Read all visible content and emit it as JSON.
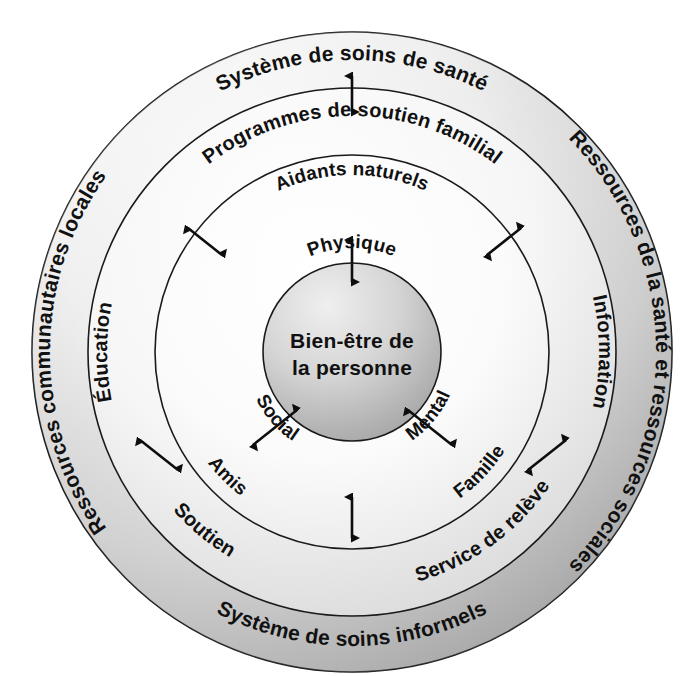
{
  "diagram": {
    "colors": {
      "background": "#ffffff",
      "outline": "#1a1a1a",
      "text": "#111111",
      "ring_outer_light": "#f2f2f2",
      "ring_outer_dark": "#b4b4b4",
      "ring_two_light": "#fbfbfb",
      "ring_two_dark": "#dcdcdc",
      "ring_three_light": "#ffffff",
      "ring_three_dark": "#ededed",
      "core_light": "#eeeeee",
      "core_dark": "#a8a8a8",
      "arrow": "#0d0d0d"
    },
    "rings": [
      {
        "id": "ring-outer",
        "name": "systeme-de-soins-informels",
        "labels": {
          "top": "Système de soins de santé",
          "bottom": "Système de soins informels",
          "left": "Ressources communautaires locales",
          "right": "Ressources de la santé et ressources sociales"
        }
      },
      {
        "id": "ring-two",
        "name": "programmes-de-soutien-familial",
        "labels": {
          "top": "Programmes de soutien familial",
          "bottom_left": "Soutien",
          "bottom_right": "Service de relève",
          "left": "Éducation",
          "right": "Information"
        }
      },
      {
        "id": "ring-three",
        "name": "aidants-naturels",
        "labels": {
          "top": "Aidants naturels",
          "bottom_left": "Amis",
          "bottom_right": "Famille"
        }
      },
      {
        "id": "core",
        "name": "bien-etre-de-la-personne",
        "labels": {
          "top": "Physique",
          "center_line1": "Bien-être de",
          "center_line2": "la personne",
          "bottom_left": "Social",
          "bottom_right": "Mental"
        }
      }
    ],
    "arrows": [
      {
        "name": "arrow-ring-outer-to-ring-two-top",
        "type": "double-headed",
        "orientation": "vertical"
      },
      {
        "name": "arrow-ring-three-to-core-top",
        "type": "double-headed",
        "orientation": "vertical"
      },
      {
        "name": "arrow-core-to-ring-three-lower-left",
        "type": "double-headed",
        "orientation": "diagonal"
      },
      {
        "name": "arrow-core-to-ring-three-lower-right",
        "type": "double-headed",
        "orientation": "diagonal"
      },
      {
        "name": "arrow-ring-two-to-ring-three-upper-left",
        "type": "double-headed",
        "orientation": "diagonal"
      },
      {
        "name": "arrow-ring-two-to-ring-three-upper-right",
        "type": "double-headed",
        "orientation": "diagonal"
      },
      {
        "name": "arrow-ring-outer-to-ring-two-lower-left",
        "type": "double-headed",
        "orientation": "diagonal"
      },
      {
        "name": "arrow-ring-outer-to-ring-two-lower-right",
        "type": "double-headed",
        "orientation": "diagonal"
      },
      {
        "name": "arrow-ring-two-to-ring-three-bottom",
        "type": "double-headed",
        "orientation": "vertical"
      }
    ]
  }
}
